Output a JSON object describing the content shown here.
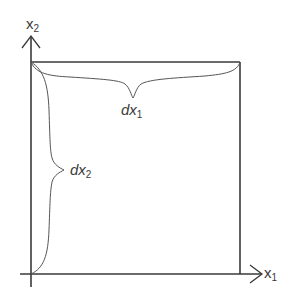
{
  "diagram": {
    "type": "element-of-area",
    "axes": {
      "x_axis": {
        "name": "x",
        "subscript": "1"
      },
      "y_axis": {
        "name": "x",
        "subscript": "2"
      }
    },
    "box": {
      "description": "square differential element"
    },
    "braces": [
      {
        "id": "dx1",
        "label": "dx",
        "subscript": "1",
        "orientation": "horizontal"
      },
      {
        "id": "dx2",
        "label": "dx",
        "subscript": "2",
        "orientation": "vertical"
      }
    ],
    "colors": {
      "stroke": "#3a3a3a",
      "brace": "#555555",
      "background": "#ffffff"
    }
  }
}
